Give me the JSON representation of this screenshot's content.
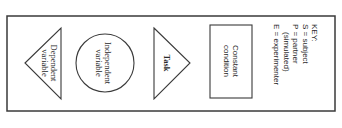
{
  "diagram": {
    "orientation": "rotated-90-clockwise",
    "shapes": [
      {
        "id": "dependent",
        "type": "triangle",
        "lines": [
          "Dependent",
          "variable"
        ]
      },
      {
        "id": "independent",
        "type": "circle",
        "lines": [
          "Independent",
          "variable"
        ]
      },
      {
        "id": "task",
        "type": "triangle",
        "lines": [
          "Task"
        ]
      },
      {
        "id": "constant",
        "type": "rectangle",
        "lines": [
          "Constant",
          "condition"
        ]
      }
    ],
    "key": {
      "title": "KEY:",
      "lines": [
        "S = subject",
        "P = partner",
        "(simulated)",
        "E = experimenter"
      ]
    }
  },
  "colors": {
    "stroke": "#3a3a3a",
    "text": "#2a2a2a",
    "background": "#ffffff"
  }
}
